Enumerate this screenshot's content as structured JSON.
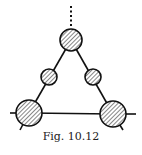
{
  "figure": {
    "caption": "Fig. 10.12",
    "colors": {
      "stroke": "#111111",
      "background": "#ffffff"
    },
    "nodes": [
      {
        "id": "top",
        "cx": 71,
        "cy": 40,
        "r": 11,
        "hatched": true
      },
      {
        "id": "left-mid",
        "cx": 49,
        "cy": 77,
        "r": 8,
        "hatched": true
      },
      {
        "id": "right-mid",
        "cx": 93,
        "cy": 77,
        "r": 8,
        "hatched": true
      },
      {
        "id": "bottom-left",
        "cx": 29,
        "cy": 113,
        "r": 13,
        "hatched": true
      },
      {
        "id": "bottom-right",
        "cx": 113,
        "cy": 114,
        "r": 13,
        "hatched": true
      }
    ],
    "external_lines": [
      {
        "id": "top-dotted",
        "style": "dotted"
      },
      {
        "id": "left-horizontal",
        "style": "solid"
      },
      {
        "id": "right-horizontal",
        "style": "solid"
      },
      {
        "id": "left-leg",
        "style": "solid"
      },
      {
        "id": "right-leg",
        "style": "solid"
      }
    ]
  }
}
